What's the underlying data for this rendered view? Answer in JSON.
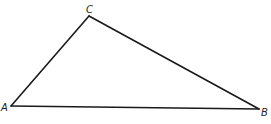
{
  "diagram": {
    "type": "triangle",
    "vertices": [
      {
        "id": "A",
        "label": "A"
      },
      {
        "id": "B",
        "label": "B"
      },
      {
        "id": "C",
        "label": "C"
      }
    ],
    "edges": [
      {
        "from": "A",
        "to": "B",
        "name": "AB"
      },
      {
        "from": "B",
        "to": "C",
        "name": "BC"
      },
      {
        "from": "C",
        "to": "A",
        "name": "CA"
      }
    ],
    "colors": {
      "line": "#1a1a1a",
      "label": "#222222",
      "background": "#ffffff"
    }
  }
}
